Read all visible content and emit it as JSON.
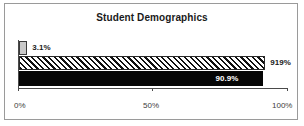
{
  "chart_data": {
    "type": "bar",
    "orientation": "horizontal",
    "title": "Student Demographics",
    "xlabel": "",
    "ylabel": "",
    "xlim": [
      0,
      100
    ],
    "grid": false,
    "legend": "none",
    "xticks": [
      {
        "value": 0,
        "label": "0%"
      },
      {
        "value": 50,
        "label": "50%"
      },
      {
        "value": 100,
        "label": "100%"
      }
    ],
    "categories": [
      "series-1",
      "series-2",
      "series-3"
    ],
    "values": [
      3.1,
      91.9,
      90.9
    ],
    "bars": [
      {
        "name": "series-1",
        "value": 3.1,
        "label": "3.1%",
        "label_position": "outside",
        "fill": "solid-gray",
        "color": "#c8c8c8"
      },
      {
        "name": "series-2",
        "value": 91.9,
        "label": "919%",
        "label_position": "outside",
        "fill": "diagonal-hatch",
        "color": "#ffffff"
      },
      {
        "name": "series-3",
        "value": 90.9,
        "label": "90.9%",
        "label_position": "inside",
        "fill": "solid-black",
        "color": "#050505"
      }
    ]
  },
  "colors": {
    "border": "#9a9a9a",
    "axis": "#4a4a4a",
    "title_text": "#1a1a1a",
    "tick_text": "#3d3d3d",
    "inside_label_text": "#ffffff"
  }
}
